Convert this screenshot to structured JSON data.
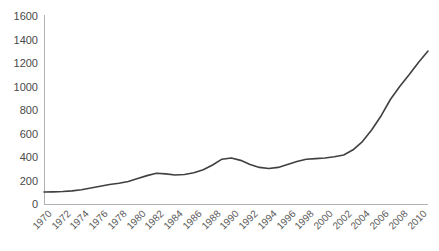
{
  "chart_data": {
    "type": "line",
    "title": "",
    "xlabel": "",
    "ylabel": "",
    "ylim": [
      0,
      1600
    ],
    "ytick_step": 200,
    "yticks": [
      1600,
      1400,
      1200,
      1000,
      800,
      600,
      400,
      200,
      0
    ],
    "grid": false,
    "legend": "none",
    "line_color": "#404040",
    "axis_color": "#b3b3b3",
    "tick_label_color": "#4a4a4a",
    "xticks": [
      "1970",
      "1972",
      "1974",
      "1976",
      "1978",
      "1980",
      "1982",
      "1984",
      "1986",
      "1988",
      "1990",
      "1992",
      "1994",
      "1996",
      "1998",
      "2000",
      "2002",
      "2004",
      "2006",
      "2008",
      "2010"
    ],
    "x": [
      1970,
      1971,
      1972,
      1973,
      1974,
      1975,
      1976,
      1977,
      1978,
      1979,
      1980,
      1981,
      1982,
      1983,
      1984,
      1985,
      1986,
      1987,
      1988,
      1989,
      1990,
      1991,
      1992,
      1993,
      1994,
      1995,
      1996,
      1997,
      1998,
      1999,
      2000,
      2001,
      2002,
      2003,
      2004,
      2005,
      2006,
      2007,
      2008,
      2009,
      2010,
      2011
    ],
    "values": [
      110,
      112,
      115,
      120,
      130,
      145,
      160,
      175,
      185,
      200,
      225,
      250,
      270,
      265,
      255,
      260,
      275,
      300,
      340,
      390,
      400,
      380,
      345,
      320,
      310,
      320,
      345,
      370,
      390,
      395,
      400,
      410,
      425,
      470,
      540,
      640,
      760,
      900,
      1010,
      1110,
      1215,
      1310
    ],
    "series": [
      {
        "name": "series-1",
        "values": [
          110,
          112,
          115,
          120,
          130,
          145,
          160,
          175,
          185,
          200,
          225,
          250,
          270,
          265,
          255,
          260,
          275,
          300,
          340,
          390,
          400,
          380,
          345,
          320,
          310,
          320,
          345,
          370,
          390,
          395,
          400,
          410,
          425,
          470,
          540,
          640,
          760,
          900,
          1010,
          1110,
          1215,
          1310
        ]
      }
    ],
    "xlim": [
      1970,
      2011
    ]
  },
  "plot_geometry": {
    "left": 44,
    "right": 428,
    "top": 17,
    "bottom": 205
  }
}
